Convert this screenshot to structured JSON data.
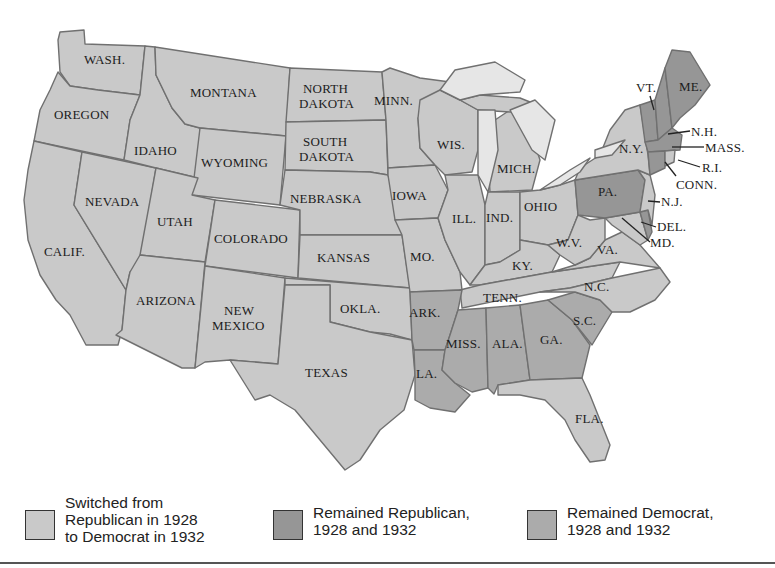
{
  "map": {
    "title": "",
    "colors": {
      "switched": "#c9c9c9",
      "remained_republican": "#969696",
      "remained_democrat": "#ababab",
      "lakes": "#e6e6e6",
      "border": "#707070"
    },
    "state_labels": {
      "wash": "WASH.",
      "oregon": "OREGON",
      "calif": "CALIF.",
      "idaho": "IDAHO",
      "nevada": "NEVADA",
      "montana": "MONTANA",
      "wyoming": "WYOMING",
      "utah": "UTAH",
      "arizona": "ARIZONA",
      "colorado": "COLORADO",
      "new_mexico_1": "NEW",
      "new_mexico_2": "MEXICO",
      "north_dakota_1": "NORTH",
      "north_dakota_2": "DAKOTA",
      "south_dakota_1": "SOUTH",
      "south_dakota_2": "DAKOTA",
      "nebraska": "NEBRASKA",
      "kansas": "KANSAS",
      "okla": "OKLA.",
      "texas": "TEXAS",
      "minn": "MINN.",
      "iowa": "IOWA",
      "mo": "MO.",
      "ark": "ARK.",
      "la": "LA.",
      "wis": "WIS.",
      "ill": "ILL.",
      "mich": "MICH.",
      "ind": "IND.",
      "ohio": "OHIO",
      "ky": "KY.",
      "tenn": "TENN.",
      "miss": "MISS.",
      "ala": "ALA.",
      "ga": "GA.",
      "fla": "FLA.",
      "sc": "S.C.",
      "nc": "N.C.",
      "va": "VA.",
      "wv": "W.V.",
      "pa": "PA.",
      "ny": "N.Y.",
      "vt": "VT.",
      "me": "ME.",
      "nh": "N.H.",
      "mass": "MASS.",
      "ri": "R.I.",
      "conn": "CONN.",
      "nj": "N.J.",
      "del": "DEL.",
      "md": "MD."
    },
    "groups": {
      "switched_from_republican_to_democrat": [
        "WASH.",
        "OREGON",
        "CALIF.",
        "IDAHO",
        "NEVADA",
        "MONTANA",
        "WYOMING",
        "UTAH",
        "ARIZONA",
        "COLORADO",
        "NEW MEXICO",
        "NORTH DAKOTA",
        "SOUTH DAKOTA",
        "NEBRASKA",
        "KANSAS",
        "OKLA.",
        "TEXAS",
        "MINN.",
        "IOWA",
        "MO.",
        "WIS.",
        "ILL.",
        "MICH.",
        "IND.",
        "OHIO",
        "KY.",
        "TENN.",
        "FLA.",
        "N.C.",
        "VA.",
        "W.V.",
        "N.Y.",
        "N.J.",
        "MD.",
        "R.I."
      ],
      "remained_republican": [
        "PA.",
        "VT.",
        "ME.",
        "N.H.",
        "CONN.",
        "DEL."
      ],
      "remained_democrat": [
        "ARK.",
        "LA.",
        "MISS.",
        "ALA.",
        "GA.",
        "S.C."
      ]
    }
  },
  "legend": {
    "items": [
      {
        "label": "Switched from\nRepublican in 1928\nto Democrat in 1932",
        "color": "#c9c9c9"
      },
      {
        "label": "Remained Republican,\n1928 and 1932",
        "color": "#969696"
      },
      {
        "label": "Remained Democrat,\n1928 and 1932",
        "color": "#ababab"
      }
    ]
  }
}
